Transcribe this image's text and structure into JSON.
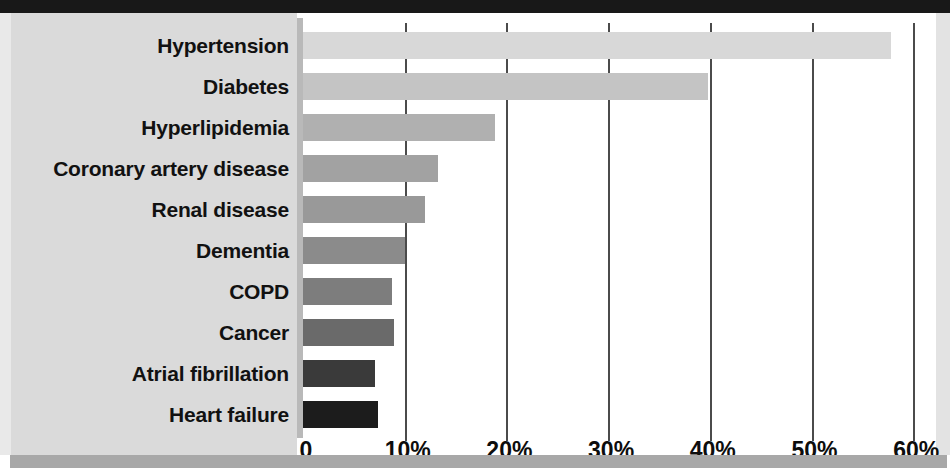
{
  "chart_data": {
    "type": "bar",
    "orientation": "horizontal",
    "title": "",
    "xlabel": "",
    "ylabel": "",
    "xlim": [
      0,
      64
    ],
    "grid": true,
    "legend": false,
    "xticks": [
      "0",
      "10%",
      "20%",
      "30%",
      "40%",
      "50%",
      "60%"
    ],
    "xtick_values": [
      0,
      10,
      20,
      30,
      40,
      50,
      60
    ],
    "categories": [
      "Hypertension",
      "Diabetes",
      "Hyperlipidemia",
      "Coronary artery disease",
      "Renal disease",
      "Dementia",
      "COPD",
      "Cancer",
      "Atrial fibrillation",
      "Heart failure"
    ],
    "values": [
      57.8,
      39.8,
      18.9,
      13.3,
      12.0,
      10.0,
      8.8,
      8.9,
      7.1,
      7.4
    ],
    "bar_colors": [
      "#d8d8d8",
      "#c4c4c4",
      "#b0b0b0",
      "#a2a2a2",
      "#999999",
      "#8b8b8b",
      "#7d7d7d",
      "#6a6a6a",
      "#3a3a3a",
      "#1c1c1c"
    ]
  },
  "style": {
    "label_panel_color": "#dadada",
    "plot_background": "#ffffff",
    "gridline_color": "#4b4b4b",
    "axis_spine_color": "#b9b9b9",
    "top_strip_color": "#181818",
    "bottom_strip_color": "#a8a8a8",
    "text_color": "#111111"
  }
}
